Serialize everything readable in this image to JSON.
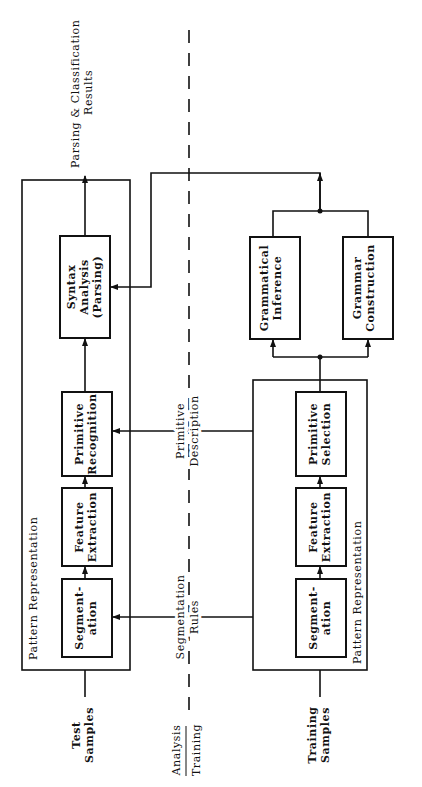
{
  "diagram": {
    "divider": {
      "top": "Analysis",
      "bottom": "Training"
    },
    "analysis": {
      "input": [
        "Test",
        "Samples"
      ],
      "group_label": "Pattern Representation",
      "segmentation": [
        "Segment-",
        "ation"
      ],
      "feature_extraction": [
        "Feature",
        "Extraction"
      ],
      "primitive_recognition": [
        "Primitive",
        "Recognition"
      ],
      "syntax_analysis": [
        "Syntax",
        "Analysis",
        "(Parsing)"
      ],
      "output": [
        "Parsing & Classification",
        "Results"
      ]
    },
    "links": {
      "segmentation_rules": [
        "Segmentation",
        "Rules"
      ],
      "primitive_description": [
        "Primitive",
        "Description"
      ]
    },
    "training": {
      "input": [
        "Training",
        "Samples"
      ],
      "group_label": "Pattern Representation",
      "segmentation": [
        "Segment-",
        "ation"
      ],
      "feature_extraction": [
        "Feature",
        "Extraction"
      ],
      "primitive_selection": [
        "Primitive",
        "Selection"
      ],
      "grammatical_inference": [
        "Grammatical",
        "Inference"
      ],
      "grammar_construction": [
        "Grammar",
        "Construction"
      ]
    }
  }
}
